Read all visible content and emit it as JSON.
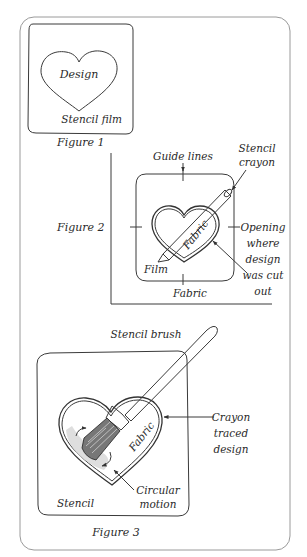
{
  "figure1": {
    "caption": "Figure 1",
    "design_label": "Design",
    "film_label": "Stencil film"
  },
  "figure2": {
    "caption": "Figure 2",
    "guide_lines_label": "Guide lines",
    "crayon_label_line1": "Stencil",
    "crayon_label_line2": "crayon",
    "fabric_inner_label": "Fabric",
    "film_label": "Film",
    "fabric_outer_label": "Fabric",
    "opening_lines": [
      "Opening",
      "where",
      "design",
      "was cut",
      "out"
    ]
  },
  "figure3": {
    "caption": "Figure 3",
    "brush_label": "Stencil brush",
    "fabric_label": "Fabric",
    "stencil_label": "Stencil",
    "crayon_traced_lines": [
      "Crayon",
      "traced",
      "design"
    ],
    "circular_motion_lines": [
      "Circular",
      "motion"
    ]
  }
}
